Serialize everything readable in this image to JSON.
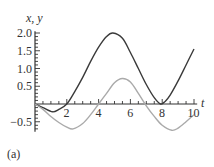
{
  "chart_data": {
    "type": "line",
    "title": "",
    "xlabel": "t",
    "ylabel": "x, y",
    "xlim": [
      0,
      10
    ],
    "ylim": [
      -0.8,
      2.1
    ],
    "grid": false,
    "legend": null,
    "x_ticks": [
      2,
      4,
      6,
      8,
      10
    ],
    "y_ticks": [
      -0.5,
      0.5,
      1.0,
      1.5,
      2.0
    ],
    "x_tick_labels": [
      "2",
      "4",
      "6",
      "8",
      "10"
    ],
    "y_tick_labels": [
      "−0.5",
      "0.5",
      "1.0",
      "1.5",
      "2.0"
    ],
    "series": [
      {
        "name": "x",
        "color": "#3a3a3a",
        "points": [
          [
            0,
            0
          ],
          [
            0.5,
            -0.1
          ],
          [
            1.1,
            -0.22
          ],
          [
            1.5,
            -0.15
          ],
          [
            2,
            0
          ],
          [
            2.5,
            0.35
          ],
          [
            3,
            0.75
          ],
          [
            3.5,
            1.2
          ],
          [
            4,
            1.6
          ],
          [
            4.5,
            1.9
          ],
          [
            4.9,
            2.0
          ],
          [
            5.5,
            1.85
          ],
          [
            6,
            1.45
          ],
          [
            6.5,
            1.0
          ],
          [
            7,
            0.55
          ],
          [
            7.5,
            0.18
          ],
          [
            7.9,
            0
          ],
          [
            8.2,
            0.08
          ],
          [
            8.5,
            0.25
          ],
          [
            9,
            0.65
          ],
          [
            9.5,
            1.1
          ],
          [
            10,
            1.55
          ]
        ]
      },
      {
        "name": "y",
        "color": "#aaaaaa",
        "points": [
          [
            0,
            0
          ],
          [
            0.5,
            -0.15
          ],
          [
            1,
            -0.35
          ],
          [
            1.5,
            -0.52
          ],
          [
            2,
            -0.65
          ],
          [
            2.4,
            -0.7
          ],
          [
            3,
            -0.55
          ],
          [
            3.5,
            -0.3
          ],
          [
            4,
            0
          ],
          [
            4.5,
            0.3
          ],
          [
            5,
            0.6
          ],
          [
            5.5,
            0.72
          ],
          [
            6,
            0.62
          ],
          [
            6.5,
            0.3
          ],
          [
            7,
            -0.05
          ],
          [
            7.5,
            -0.35
          ],
          [
            8,
            -0.6
          ],
          [
            8.6,
            -0.74
          ],
          [
            9,
            -0.68
          ],
          [
            9.5,
            -0.5
          ],
          [
            10,
            -0.3
          ]
        ]
      }
    ],
    "annotations": [
      "(a)"
    ]
  },
  "labels": {
    "y_axis": "x, y",
    "x_axis": "t",
    "panel": "(a)"
  },
  "layout": {
    "origin_px": [
      35,
      104
    ],
    "px_per_x": 15.9,
    "px_per_y": 35.5
  }
}
